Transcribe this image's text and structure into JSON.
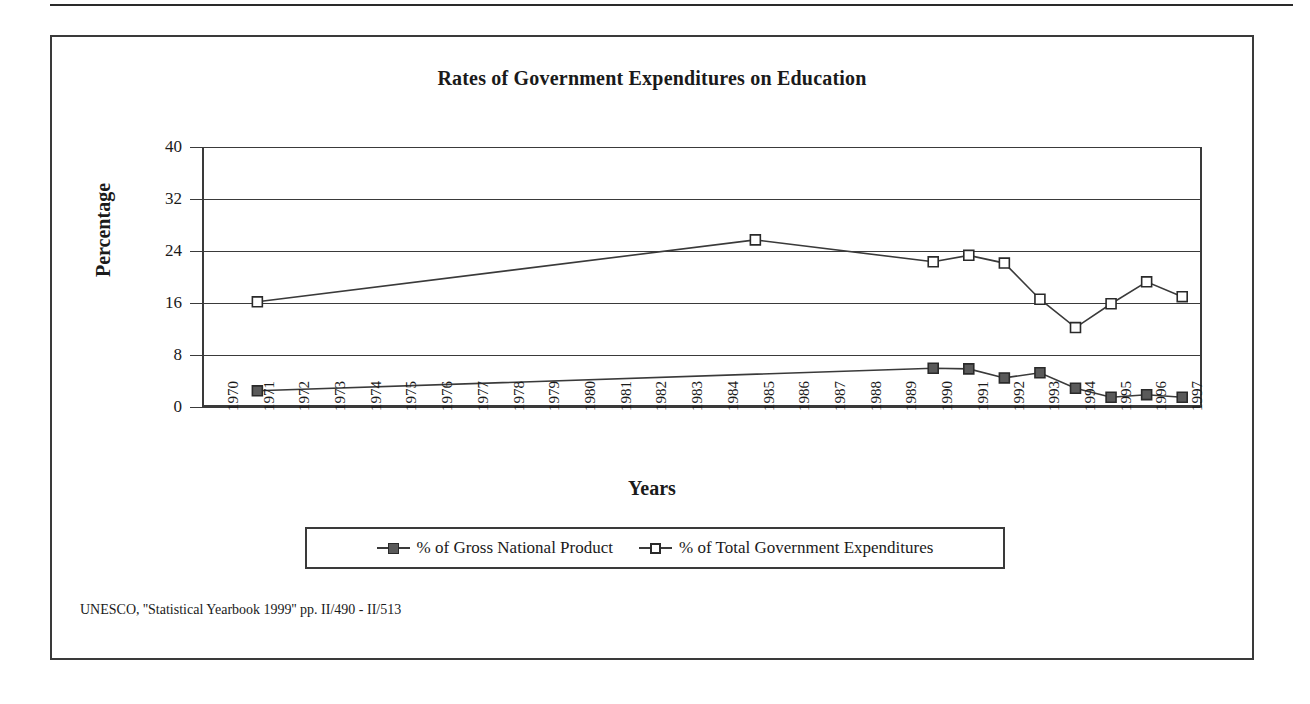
{
  "figure": {
    "title": "Rates of Government Expenditures on Education",
    "source_note": "UNESCO, ''Statistical Yearbook 1999'' pp. II/490 - II/513"
  },
  "legend": {
    "entries": [
      {
        "label": "% of Gross National Product",
        "marker": "filled-square",
        "color": "#5a5a5a"
      },
      {
        "label": "% of Total Government Expenditures",
        "marker": "open-square",
        "color": "#ffffff"
      }
    ]
  },
  "chart_data": {
    "type": "line",
    "title": "Rates of Government Expenditures on Education",
    "xlabel": "Years",
    "ylabel": "Percentage",
    "ylim": [
      0,
      40
    ],
    "yticks": [
      0,
      8,
      16,
      24,
      32,
      40
    ],
    "grid": true,
    "legend_position": "bottom",
    "categories": [
      "1970",
      "1971",
      "1972",
      "1973",
      "1974",
      "1975",
      "1976",
      "1977",
      "1978",
      "1979",
      "1980",
      "1981",
      "1982",
      "1983",
      "1984",
      "1985",
      "1986",
      "1987",
      "1988",
      "1989",
      "1990",
      "1991",
      "1992",
      "1993",
      "1994",
      "1995",
      "1996",
      "1997"
    ],
    "series": [
      {
        "name": "% of Gross National Product",
        "marker": "filled-square",
        "values": [
          null,
          2.2,
          null,
          null,
          null,
          null,
          null,
          null,
          null,
          null,
          null,
          null,
          null,
          null,
          null,
          null,
          null,
          null,
          null,
          null,
          5.7,
          5.6,
          4.2,
          5.0,
          2.6,
          1.2,
          1.6,
          1.2
        ]
      },
      {
        "name": "% of Total Government Expenditures",
        "marker": "open-square",
        "values": [
          null,
          16.0,
          null,
          null,
          null,
          null,
          null,
          null,
          null,
          null,
          null,
          null,
          null,
          null,
          null,
          25.6,
          null,
          null,
          null,
          null,
          22.2,
          23.2,
          22.0,
          16.4,
          12.0,
          15.7,
          19.1,
          16.8
        ]
      }
    ]
  }
}
